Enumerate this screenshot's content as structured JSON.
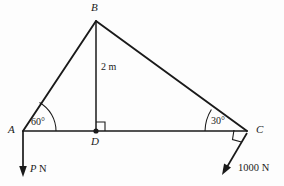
{
  "figure": {
    "type": "statics-force-diagram",
    "background_color": "#fdfdfd",
    "line_color": "#1a1a1a"
  },
  "vertices": [
    {
      "id": "A",
      "label": "A",
      "x": 23,
      "y": 131,
      "label_x": 8,
      "label_y": 126
    },
    {
      "id": "B",
      "label": "B",
      "x": 96,
      "y": 21,
      "label_x": 92,
      "label_y": 3
    },
    {
      "id": "C",
      "label": "C",
      "x": 247,
      "y": 131,
      "label_x": 256,
      "label_y": 126
    },
    {
      "id": "D",
      "label": "D",
      "x": 96,
      "y": 131,
      "label_x": 92,
      "label_y": 136
    }
  ],
  "members": [
    {
      "name": "member-ab",
      "from": "A",
      "to": "B"
    },
    {
      "name": "member-bc",
      "from": "B",
      "to": "C"
    },
    {
      "name": "member-ac",
      "from": "A",
      "to": "C"
    },
    {
      "name": "member-bd",
      "from": "B",
      "to": "D"
    }
  ],
  "angles": [
    {
      "id": "angle-a",
      "label": "60°",
      "at": "A",
      "label_x": 31,
      "label_y": 119
    },
    {
      "id": "angle-c",
      "label": "30°",
      "at": "C",
      "label_x": 212,
      "label_y": 118
    }
  ],
  "right_angles": [
    {
      "id": "right-angle-d",
      "at": "D"
    },
    {
      "id": "right-angle-c",
      "at": "C"
    }
  ],
  "dimensions": [
    {
      "id": "dim-bd",
      "label": "2 m",
      "member": "member-bd",
      "label_x": 100,
      "label_y": 67
    }
  ],
  "forces": [
    {
      "id": "force-p",
      "label_italic": "P",
      "label_unit": " N",
      "applied_at": "A",
      "direction_deg": 270,
      "label_x": 29,
      "label_y": 166
    },
    {
      "id": "force-1000",
      "label": "1000 N",
      "applied_at": "C",
      "direction_deg": 240,
      "label_x": 239,
      "label_y": 165
    }
  ]
}
